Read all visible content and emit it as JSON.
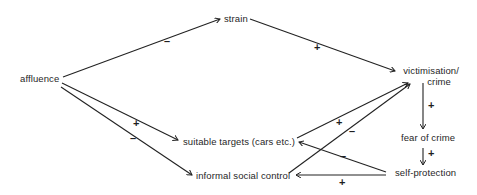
{
  "diagram": {
    "type": "causal-loop",
    "nodes": {
      "affluence": "affluence",
      "strain": "strain",
      "victimisation_line1": "victimisation/",
      "victimisation_line2": "crime",
      "suitable_targets": "suitable targets (cars etc.)",
      "informal_social_control": "informal social control",
      "fear_of_crime": "fear of crime",
      "self_protection": "self-protection"
    },
    "edges": [
      {
        "from": "affluence",
        "to": "strain",
        "sign": "–"
      },
      {
        "from": "strain",
        "to": "victimisation/crime",
        "sign": "+"
      },
      {
        "from": "affluence",
        "to": "suitable targets (cars etc.)",
        "sign": "+"
      },
      {
        "from": "affluence",
        "to": "informal social control",
        "sign": "–"
      },
      {
        "from": "suitable targets (cars etc.)",
        "to": "victimisation/crime",
        "sign": "+"
      },
      {
        "from": "informal social control",
        "to": "victimisation/crime",
        "sign": "–"
      },
      {
        "from": "victimisation/crime",
        "to": "fear of crime",
        "sign": "+"
      },
      {
        "from": "fear of crime",
        "to": "self-protection",
        "sign": "+"
      },
      {
        "from": "self-protection",
        "to": "suitable targets (cars etc.)",
        "sign": "–"
      },
      {
        "from": "self-protection",
        "to": "informal social control",
        "sign": "+"
      }
    ],
    "signs": {
      "aff_strain": "–",
      "strain_vict": "+",
      "aff_targets": "+",
      "aff_control": "–",
      "targets_vict": "+",
      "control_vict": "–",
      "vict_fear": "+",
      "fear_self": "+",
      "self_targets": "–",
      "self_control": "+"
    }
  }
}
